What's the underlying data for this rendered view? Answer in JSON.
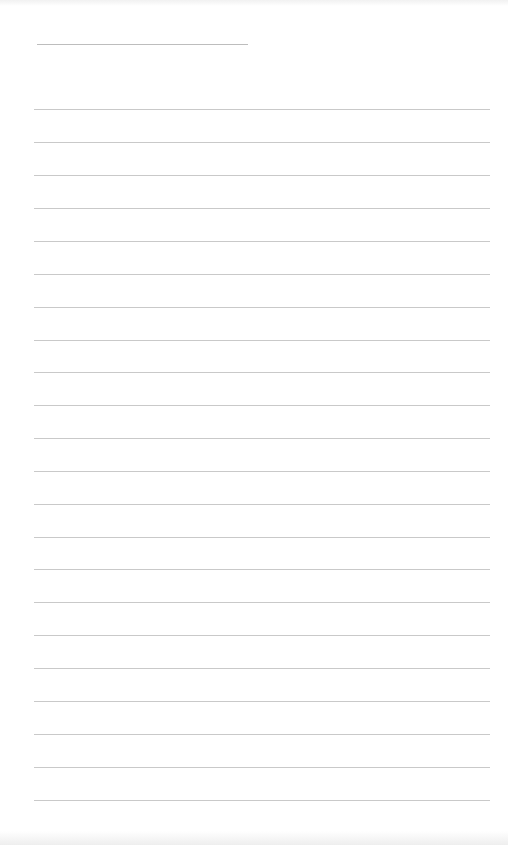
{
  "document": {
    "type": "lined-paper",
    "background_color": "#ffffff",
    "line_color": "#c9c9c9",
    "header_line": {
      "x1": 37,
      "x2": 248,
      "y": 44
    },
    "ruled_lines": {
      "x1": 34,
      "x2": 490,
      "spacing": 32.9,
      "count": 22,
      "y_positions": [
        109,
        142,
        175,
        208,
        241,
        274,
        307,
        340,
        372,
        405,
        438,
        471,
        504,
        537,
        569,
        602,
        635,
        668,
        701,
        734,
        767,
        800
      ]
    }
  }
}
